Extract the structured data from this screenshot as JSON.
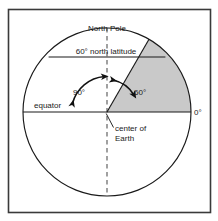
{
  "figure": {
    "title_alt": "Cross-section of Earth showing 60 degree north latitude",
    "frame": {
      "stroke": "#3a3a3a"
    },
    "colors": {
      "outline": "#1a1a1a",
      "sector_fill": "#c9c9c9",
      "sector_stroke": "#1a1a1a",
      "dashed_axis": "#4d4d4d",
      "text": "#1a1a1a",
      "background": "#ffffff"
    },
    "labels": {
      "north_pole": "North Pole",
      "latitude_line": "60° north latitude",
      "equator": "equator",
      "angle_ninety": "90°",
      "angle_sixty": "60°",
      "zero_degrees": "0°",
      "center_line1": "center of",
      "center_line2": "Earth"
    },
    "geometry": {
      "center_x": 107,
      "center_y": 112,
      "radius": 84,
      "latitude_chord_y": 57,
      "latitude_degrees": 60,
      "equator_degrees": 0,
      "pole_angle_degrees": 90
    }
  }
}
